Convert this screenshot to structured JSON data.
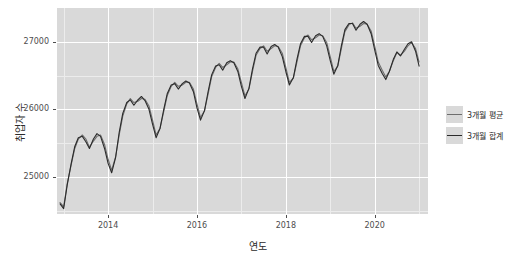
{
  "axes": {
    "y_title": "취업자 수",
    "x_title": "연도",
    "y_ticks": [
      "25000",
      "26000",
      "27000"
    ],
    "x_ticks": [
      "2014",
      "2016",
      "2018",
      "2020"
    ]
  },
  "legend": {
    "items": [
      {
        "label": "3개월 평균",
        "color": "#6e6e6e"
      },
      {
        "label": "3개월 합계",
        "color": "#2b2b2b"
      }
    ]
  },
  "chart_data": {
    "type": "line",
    "title": "",
    "xlabel": "연도",
    "ylabel": "취업자 수",
    "xlim": [
      2012.85,
      2021.2
    ],
    "ylim": [
      24450,
      27500
    ],
    "grid": true,
    "legend_position": "right",
    "x_ticks": [
      2014,
      2016,
      2018,
      2020
    ],
    "y_ticks": [
      25000,
      26000,
      27000
    ],
    "x": [
      2012.92,
      2013.0,
      2013.08,
      2013.17,
      2013.25,
      2013.33,
      2013.42,
      2013.5,
      2013.58,
      2013.67,
      2013.75,
      2013.83,
      2013.92,
      2014.0,
      2014.08,
      2014.17,
      2014.25,
      2014.33,
      2014.42,
      2014.5,
      2014.58,
      2014.67,
      2014.75,
      2014.83,
      2014.92,
      2015.0,
      2015.08,
      2015.17,
      2015.25,
      2015.33,
      2015.42,
      2015.5,
      2015.58,
      2015.67,
      2015.75,
      2015.83,
      2015.92,
      2016.0,
      2016.08,
      2016.17,
      2016.25,
      2016.33,
      2016.42,
      2016.5,
      2016.58,
      2016.67,
      2016.75,
      2016.83,
      2016.92,
      2017.0,
      2017.08,
      2017.17,
      2017.25,
      2017.33,
      2017.42,
      2017.5,
      2017.58,
      2017.67,
      2017.75,
      2017.83,
      2017.92,
      2018.0,
      2018.08,
      2018.17,
      2018.25,
      2018.33,
      2018.42,
      2018.5,
      2018.58,
      2018.67,
      2018.75,
      2018.83,
      2018.92,
      2019.0,
      2019.08,
      2019.17,
      2019.25,
      2019.33,
      2019.42,
      2019.5,
      2019.58,
      2019.67,
      2019.75,
      2019.83,
      2019.92,
      2020.0,
      2020.08,
      2020.17,
      2020.25,
      2020.33,
      2020.42,
      2020.5,
      2020.58,
      2020.67,
      2020.75,
      2020.83,
      2020.92,
      2021.0
    ],
    "series": [
      {
        "name": "3개월 평균",
        "color": "#6e6e6e",
        "values": [
          24620,
          24560,
          24900,
          25180,
          25420,
          25560,
          25620,
          25560,
          25440,
          25530,
          25600,
          25620,
          25480,
          25260,
          25100,
          25300,
          25620,
          25900,
          26080,
          26160,
          26100,
          26120,
          26160,
          26150,
          26050,
          25840,
          25620,
          25720,
          25960,
          26200,
          26340,
          26400,
          26340,
          26360,
          26400,
          26400,
          26300,
          26080,
          25880,
          25980,
          26220,
          26480,
          26620,
          26680,
          26620,
          26660,
          26700,
          26700,
          26600,
          26400,
          26200,
          26300,
          26560,
          26800,
          26900,
          26940,
          26860,
          26900,
          26940,
          26930,
          26830,
          26620,
          26400,
          26460,
          26700,
          26940,
          27060,
          27100,
          27030,
          27060,
          27100,
          27090,
          26990,
          26780,
          26560,
          26640,
          26900,
          27150,
          27250,
          27280,
          27200,
          27230,
          27270,
          27260,
          27160,
          26940,
          26700,
          26580,
          26480,
          26560,
          26720,
          26840,
          26800,
          26860,
          26940,
          26990,
          26900,
          26700
        ]
      },
      {
        "name": "3개월 합계",
        "color": "#2b2b2b",
        "values": [
          24600,
          24530,
          24880,
          25200,
          25450,
          25580,
          25600,
          25520,
          25420,
          25560,
          25640,
          25600,
          25420,
          25200,
          25060,
          25290,
          25660,
          25940,
          26100,
          26140,
          26060,
          26140,
          26190,
          26130,
          26000,
          25780,
          25580,
          25720,
          25990,
          26230,
          26360,
          26380,
          26300,
          26380,
          26420,
          26390,
          26260,
          26020,
          25840,
          25980,
          26260,
          26510,
          26640,
          26660,
          26580,
          26690,
          26720,
          26690,
          26560,
          26340,
          26160,
          26310,
          26600,
          26830,
          26920,
          26920,
          26820,
          26930,
          26960,
          26920,
          26780,
          26560,
          26360,
          26470,
          26740,
          26970,
          27080,
          27080,
          26990,
          27090,
          27120,
          27080,
          26940,
          26720,
          26520,
          26650,
          26940,
          27180,
          27270,
          27270,
          27170,
          27260,
          27300,
          27260,
          27120,
          26880,
          26650,
          26530,
          26440,
          26560,
          26740,
          26850,
          26790,
          26890,
          26970,
          27000,
          26860,
          26640
        ]
      }
    ]
  }
}
